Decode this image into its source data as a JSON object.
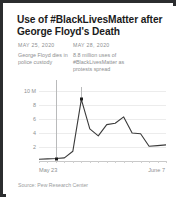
{
  "card": {
    "title": "Use of #BlackLivesMatter after George Floyd's Death",
    "source": "Source: Pew Research Center",
    "border_color": "#2b2d2f",
    "background": "#ffffff",
    "line_color": "#3a3a3a",
    "text_color": "#8d8f91",
    "grid_color": "#ececec"
  },
  "annotations": [
    {
      "date": "MAY 25, 2020",
      "body": "George Floyd dies in police custody",
      "marker_x_index": 2,
      "marker_value": 0.35
    },
    {
      "date": "MAY 28, 2020",
      "body": "8.8 million uses of #BlackLivesMatter as protests spread",
      "marker_x_index": 5,
      "marker_value": 8.8
    }
  ],
  "chart_data": {
    "type": "line",
    "title": "Use of #BlackLivesMatter after George Floyd's Death",
    "xlabel": "",
    "ylabel": "",
    "unit": "millions of uses",
    "grid": true,
    "legend": false,
    "xlim_labels": [
      "May 23",
      "June 7"
    ],
    "ylim": [
      0,
      10
    ],
    "ytick_labels": [
      "10 M",
      "8",
      "6",
      "4",
      "2"
    ],
    "yticks": [
      10,
      8,
      6,
      4,
      2
    ],
    "x": [
      "May 23",
      "May 24",
      "May 25",
      "May 26",
      "May 27",
      "May 28",
      "May 29",
      "May 30",
      "May 31",
      "June 1",
      "June 2",
      "June 3",
      "June 4",
      "June 5",
      "June 6",
      "June 7"
    ],
    "values": [
      0.25,
      0.3,
      0.35,
      0.45,
      1.4,
      8.8,
      4.6,
      3.6,
      5.2,
      5.4,
      6.3,
      4.0,
      3.9,
      2.1,
      2.2,
      2.3
    ],
    "series": [
      {
        "name": "#BlackLivesMatter uses",
        "values": [
          0.25,
          0.3,
          0.35,
          0.45,
          1.4,
          8.8,
          4.6,
          3.6,
          5.2,
          5.4,
          6.3,
          4.0,
          3.9,
          2.1,
          2.2,
          2.3
        ]
      }
    ]
  }
}
